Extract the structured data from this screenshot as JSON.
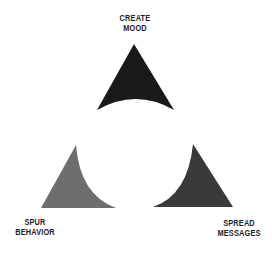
{
  "diagram": {
    "type": "triangle-cycle",
    "background": "#ffffff",
    "nodes": [
      {
        "id": "create-mood",
        "label_lines": [
          "CREATE",
          "MOOD"
        ],
        "position": "top",
        "color": "#1a1a1a"
      },
      {
        "id": "spur-behavior",
        "label_lines": [
          "SPUR",
          "BEHAVIOR"
        ],
        "position": "bottom-left",
        "color": "#6e6e6e"
      },
      {
        "id": "spread-messages",
        "label_lines": [
          "SPREAD",
          "MESSAGES"
        ],
        "position": "bottom-right",
        "color": "#3a3a3a"
      }
    ]
  }
}
